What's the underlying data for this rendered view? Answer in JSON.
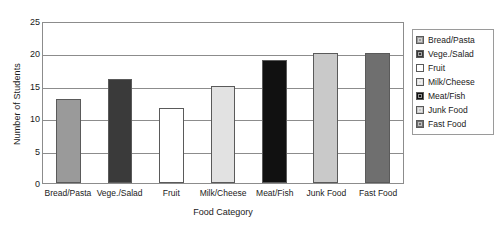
{
  "chart_data": {
    "type": "bar",
    "title": "",
    "xlabel": "Food Category",
    "ylabel": "Number of Students",
    "categories": [
      "Bread/Pasta",
      "Vege./Salad",
      "Fruit",
      "Milk/Cheese",
      "Meat/Fish",
      "Junk Food",
      "Fast Food"
    ],
    "values": [
      13,
      16,
      11.5,
      15,
      19,
      20,
      20
    ],
    "colors": [
      "#9a9a9a",
      "#3a3a3a",
      "#ffffff",
      "#e2e2e2",
      "#111111",
      "#c9c9c9",
      "#6f6f6f"
    ],
    "ylim": [
      0,
      25
    ],
    "yticks": [
      0,
      5,
      10,
      15,
      20,
      25
    ],
    "ytick_labels": [
      "0",
      "5",
      "10",
      "15",
      "20",
      "25"
    ],
    "grid": true,
    "grid_axis": "y",
    "legend_position": "right",
    "legend": [
      {
        "label": "Bread/Pasta",
        "color": "#9a9a9a"
      },
      {
        "label": "Vege./Salad",
        "color": "#3a3a3a"
      },
      {
        "label": "Fruit",
        "color": "#ffffff"
      },
      {
        "label": "Milk/Cheese",
        "color": "#e2e2e2"
      },
      {
        "label": "Meat/Fish",
        "color": "#111111"
      },
      {
        "label": "Junk Food",
        "color": "#c9c9c9"
      },
      {
        "label": "Fast Food",
        "color": "#6f6f6f"
      }
    ]
  }
}
